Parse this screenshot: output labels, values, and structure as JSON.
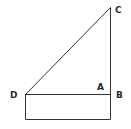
{
  "diagram": {
    "type": "geometry",
    "labels": {
      "C": "C",
      "D": "D",
      "A": "A",
      "B": "B"
    },
    "points": {
      "C": [
        110,
        7
      ],
      "D": [
        25,
        94
      ],
      "B": [
        110,
        94
      ],
      "bottom_left": [
        25,
        119
      ],
      "bottom_right": [
        110,
        119
      ]
    },
    "line_color": "#333333",
    "label_color": "#2a2a2a"
  }
}
